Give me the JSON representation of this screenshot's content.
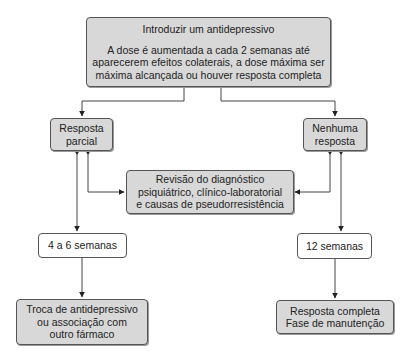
{
  "diagram": {
    "start": {
      "title": "Introduzir um antidepressivo",
      "lines": [
        "A dose é aumentada a cada 2 semanas até",
        "aparecerem efeitos colaterais, a dose máxima ser",
        "máxima alcançada ou houver resposta completa"
      ]
    },
    "partial_response": {
      "lines": [
        "Resposta",
        "parcial"
      ]
    },
    "no_response": {
      "lines": [
        "Nenhuma",
        "resposta"
      ]
    },
    "review": {
      "lines": [
        "Revisão do diagnóstico",
        "psiquiátrico, clínico-laboratorial",
        "e causas de pseudorresistência"
      ]
    },
    "weeks_4_6": {
      "label": "4 a 6 semanas"
    },
    "weeks_12": {
      "label": "12 semanas"
    },
    "switch": {
      "lines": [
        "Troca de antidepressivo",
        "ou associação com",
        "outro fármaco"
      ]
    },
    "complete": {
      "lines": [
        "Resposta completa",
        "Fase de manutenção"
      ]
    },
    "colors": {
      "box_fill": "#d8d8d8",
      "stroke": "#444444"
    }
  }
}
